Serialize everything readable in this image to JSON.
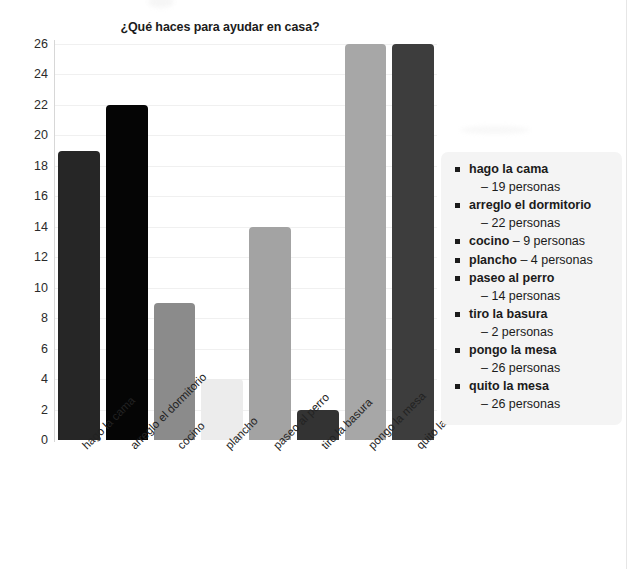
{
  "chart_data": {
    "type": "bar",
    "title": "¿Qué haces para ayudar en casa?",
    "xlabel": "",
    "ylabel": "",
    "ylim": [
      0,
      26
    ],
    "ytick_step": 2,
    "grid": true,
    "legend_position": "right",
    "categories": [
      "hago la cama",
      "arreglo el dormitorio",
      "cocino",
      "plancho",
      "paseo al perro",
      "tiro la basura",
      "pongo la mesa",
      "quito la mesa"
    ],
    "values": [
      19,
      22,
      9,
      4,
      14,
      2,
      26,
      26
    ],
    "bar_colors": [
      "#262626",
      "#050505",
      "#8b8b8b",
      "#ececec",
      "#a3a3a3",
      "#333333",
      "#a7a7a7",
      "#3d3d3d"
    ],
    "ytick_labels": [
      "0",
      "2",
      "4",
      "6",
      "8",
      "10",
      "12",
      "14",
      "16",
      "18",
      "20",
      "22",
      "24",
      "26"
    ],
    "unit_label": "personas"
  },
  "legend": {
    "items": [
      {
        "term": "hago la cama",
        "count": "– 19 personas",
        "wrap": true
      },
      {
        "term": "arreglo el dormitorio",
        "count": "– 22 personas",
        "wrap": true
      },
      {
        "term": "cocino",
        "count": " – 9 personas",
        "wrap": false
      },
      {
        "term": "plancho",
        "count": " – 4 personas",
        "wrap": false
      },
      {
        "term": "paseo al perro",
        "count": "– 14 personas",
        "wrap": true
      },
      {
        "term": "tiro la basura",
        "count": "– 2 personas",
        "wrap": true
      },
      {
        "term": "pongo la mesa",
        "count": "– 26 personas",
        "wrap": true
      },
      {
        "term": "quito la mesa",
        "count": "– 26 personas",
        "wrap": true
      }
    ]
  },
  "colors": {
    "text": "#1b1b1b",
    "axis": "#d7d7d7",
    "grid": "#f0f0f0",
    "legend_bg": "#f4f4f4"
  }
}
